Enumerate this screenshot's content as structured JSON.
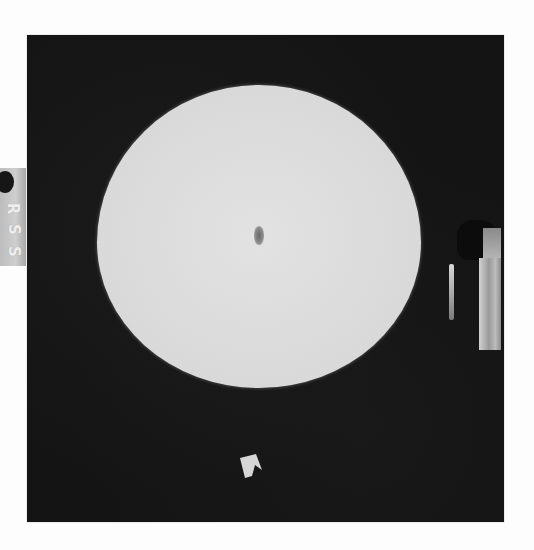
{
  "image": {
    "type": "radiograph",
    "description": "X-ray film of a circular/elliptical phantom with a small central dark density",
    "colors": {
      "page_background": "#fdfdfd",
      "film_background": "#141414",
      "phantom_fill": "#dadada",
      "lesion": "#6a6a6a",
      "marker": "#c8c8c8"
    }
  },
  "film": {
    "frame": {
      "x": 27,
      "y": 35,
      "width": 477,
      "height": 487
    }
  },
  "phantom": {
    "shape": "ellipse",
    "bounds": {
      "x": 97,
      "y": 85,
      "width": 324,
      "height": 303
    },
    "center_density": {
      "label": "central-opacity",
      "x": 258,
      "y": 238,
      "width": 10,
      "height": 19
    }
  },
  "markers": {
    "left_label": {
      "letters": [
        "R",
        "S",
        "S"
      ],
      "orientation": "rotated-90"
    },
    "right_objects": {
      "items": [
        "thin-rod",
        "wide-bar"
      ]
    },
    "bottom_arrow": {
      "shape": "arrow-pointer"
    }
  }
}
